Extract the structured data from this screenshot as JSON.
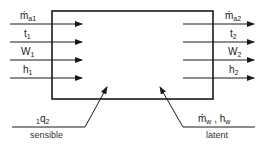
{
  "diagram": {
    "type": "control-volume energy/mass balance",
    "inputs": [
      {
        "symbol": "ṁ",
        "sub": "a1"
      },
      {
        "symbol": "t",
        "sub": "1"
      },
      {
        "symbol": "W",
        "sub": "1"
      },
      {
        "symbol": "h",
        "sub": "1"
      }
    ],
    "outputs": [
      {
        "symbol": "ṁ",
        "sub": "a2"
      },
      {
        "symbol": "t",
        "sub": "2"
      },
      {
        "symbol": "W",
        "sub": "2"
      },
      {
        "symbol": "h",
        "sub": "2"
      }
    ],
    "sensible": {
      "pre": "1",
      "symbol": "q",
      "sub": "2",
      "caption": "sensible"
    },
    "latent": {
      "sym1": "ṁ",
      "sub1": "w",
      "sep": " , ",
      "sym2": "h",
      "sub2": "w",
      "caption": "latent"
    },
    "colors": {
      "line": "#1a1a1a",
      "background": "#ffffff"
    }
  }
}
